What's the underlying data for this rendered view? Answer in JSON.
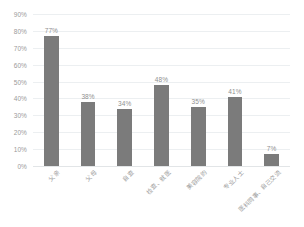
{
  "chart_data": {
    "type": "bar",
    "title": "",
    "subtitle": "",
    "xlabel": "",
    "ylabel": "",
    "categories": [
      "父亲",
      "父母",
      "自查",
      "检查、就医",
      "美容院的",
      "专业人士",
      "医科同事、自己交流"
    ],
    "values": [
      77,
      38,
      34,
      48,
      35,
      41,
      7
    ],
    "value_labels": [
      "77%",
      "38%",
      "34%",
      "48%",
      "35%",
      "41%",
      "7%"
    ],
    "ylim": [
      0,
      90
    ],
    "ytick_values": [
      0,
      10,
      20,
      30,
      40,
      50,
      60,
      70,
      80,
      90
    ],
    "ytick_labels": [
      "0%",
      "10%",
      "20%",
      "30%",
      "40%",
      "50%",
      "60%",
      "70%",
      "80%",
      "90%"
    ],
    "grid": true,
    "grid_axis": "y",
    "legend": false,
    "legend_position": "none",
    "series": [
      {
        "name": "",
        "values": [
          77,
          38,
          34,
          48,
          35,
          41,
          7
        ]
      }
    ],
    "colors": {
      "bar": "#7b7b7b",
      "gridline": "#eceff1",
      "baseline": "#e2e5e7",
      "tick_text": "#9a9a9a",
      "value_text": "#8f8f8f",
      "background": "#ffffff"
    }
  }
}
